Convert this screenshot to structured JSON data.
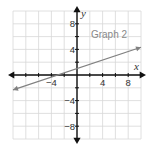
{
  "chart_data": {
    "type": "line",
    "title": "",
    "xlabel": "x",
    "ylabel": "y",
    "xlim": [
      -10,
      10
    ],
    "ylim": [
      -10,
      10
    ],
    "grid": true,
    "grid_step": 2,
    "x_ticks": [
      {
        "value": -4,
        "label": "−4"
      },
      {
        "value": 4,
        "label": "4"
      },
      {
        "value": 8,
        "label": "8"
      }
    ],
    "y_ticks": [
      {
        "value": 8,
        "label": "8"
      },
      {
        "value": 4,
        "label": "4"
      },
      {
        "value": -4,
        "label": "−4"
      },
      {
        "value": -8,
        "label": "−8"
      }
    ],
    "series": [
      {
        "name": "Graph 2",
        "equation": "y = x/3 + 1",
        "x": [
          -10,
          10
        ],
        "y": [
          -2.33,
          4.33
        ],
        "color": "#808080",
        "label_position": [
          5,
          5.8
        ]
      }
    ],
    "colors": {
      "axis": "#111111",
      "grid": "#d8d8d8",
      "line": "#808080"
    }
  }
}
